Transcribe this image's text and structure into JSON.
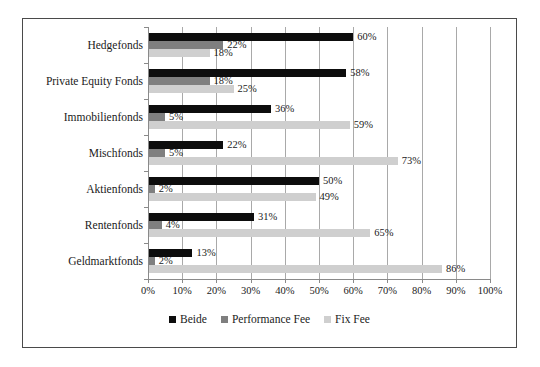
{
  "chart_data": {
    "type": "bar",
    "orientation": "horizontal",
    "title": "",
    "subtitle": "",
    "xlabel": "",
    "ylabel": "",
    "xlim": [
      0,
      100
    ],
    "ylim": null,
    "grid": true,
    "legend_position": "bottom",
    "categories": [
      "Hedgefonds",
      "Private Equity Fonds",
      "Immobilienfonds",
      "Mischfonds",
      "Aktienfonds",
      "Rentenfonds",
      "Geldmarktfonds"
    ],
    "xticks": [
      "0%",
      "10%",
      "20%",
      "30%",
      "40%",
      "50%",
      "60%",
      "70%",
      "80%",
      "90%",
      "100%"
    ],
    "xtick_values": [
      0,
      10,
      20,
      30,
      40,
      50,
      60,
      70,
      80,
      90,
      100
    ],
    "series": [
      {
        "name": "Beide",
        "color": "#0d0d0d",
        "values": [
          60,
          58,
          36,
          22,
          50,
          31,
          13
        ],
        "labels": [
          "60%",
          "58%",
          "36%",
          "22%",
          "50%",
          "31%",
          "13%"
        ]
      },
      {
        "name": "Performance Fee",
        "color": "#7f7f7f",
        "values": [
          22,
          18,
          5,
          5,
          2,
          4,
          2
        ],
        "labels": [
          "22%",
          "18%",
          "5%",
          "5%",
          "2%",
          "4%",
          "2%"
        ]
      },
      {
        "name": "Fix Fee",
        "color": "#cfcfcf",
        "values": [
          18,
          25,
          59,
          73,
          49,
          65,
          86
        ],
        "labels": [
          "18%",
          "25%",
          "59%",
          "73%",
          "49%",
          "65%",
          "86%"
        ]
      }
    ]
  },
  "legend": {
    "items": [
      {
        "label": "Beide",
        "swatch": "beide"
      },
      {
        "label": "Performance Fee",
        "swatch": "performance"
      },
      {
        "label": "Fix Fee",
        "swatch": "fix"
      }
    ]
  },
  "colors": {
    "beide": "#0d0d0d",
    "performance": "#7f7f7f",
    "fix": "#cfcfcf",
    "grid": "#a9a9a9",
    "axis": "#8a8a8a",
    "frame": "#4a4a4a",
    "text": "#1a1a1a",
    "background": "#ffffff"
  }
}
